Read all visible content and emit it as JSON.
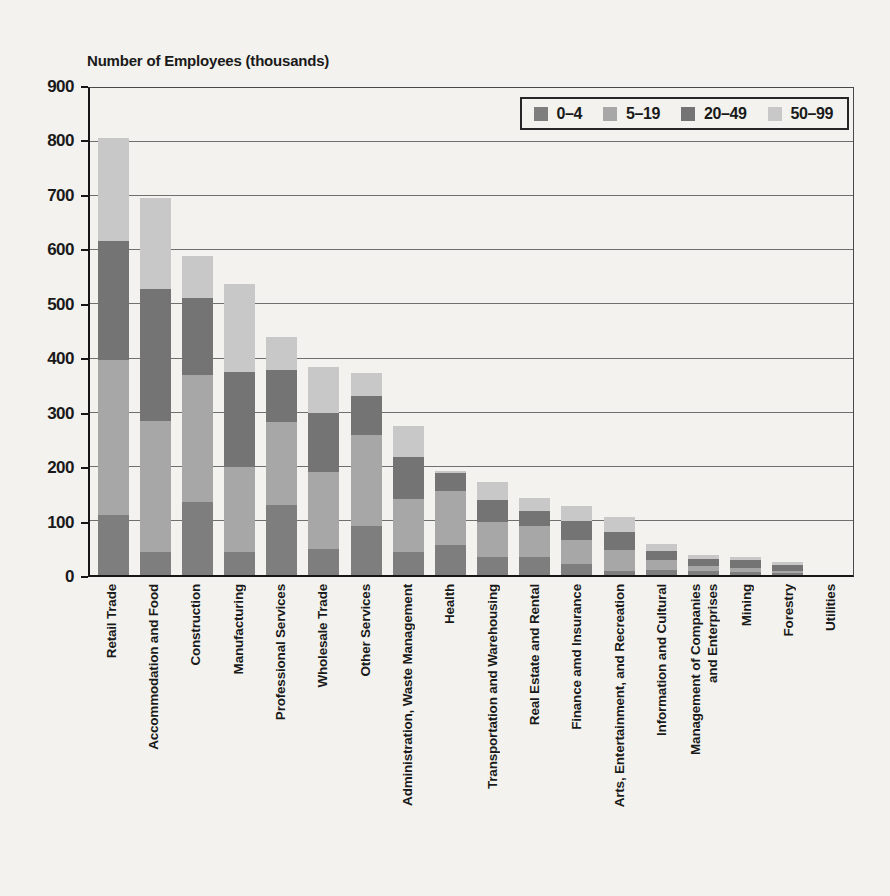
{
  "page": {
    "background": "#f3f2ee"
  },
  "chart_data": {
    "type": "bar",
    "stacked": true,
    "title": "Number of Employees (thousands)",
    "xlabel": "",
    "ylabel": "Number of Employees (thousands)",
    "ylim": [
      0,
      900
    ],
    "ytick_step": 100,
    "grid": "horizontal",
    "legend_position": "top-right",
    "categories": [
      "Retail Trade",
      "Accommodation and Food",
      "Construction",
      "Manufacturing",
      "Professional Services",
      "Wholesale Trade",
      "Other Services",
      "Administration, Waste Management",
      "Health",
      "Transportation and Warehousing",
      "Real Estate and Rental",
      "Finance amd Insurance",
      "Arts, Entertainment, and Recreation",
      "Information and Cultural",
      [
        "Management of Companies",
        "and Enterprises"
      ],
      "Mining",
      "Forestry",
      "Utilities"
    ],
    "series": [
      {
        "name": "0–4",
        "color": "#7e7e7e",
        "values": [
          110,
          42,
          135,
          43,
          130,
          48,
          90,
          42,
          55,
          33,
          33,
          20,
          7,
          10,
          8,
          6,
          4,
          0
        ]
      },
      {
        "name": "5–19",
        "color": "#a7a7a7",
        "values": [
          287,
          243,
          235,
          157,
          153,
          142,
          168,
          99,
          100,
          65,
          57,
          44,
          39,
          18,
          8,
          7,
          4,
          0
        ]
      },
      {
        "name": "20–49",
        "color": "#747474",
        "values": [
          221,
          243,
          142,
          175,
          95,
          110,
          72,
          78,
          33,
          40,
          28,
          36,
          34,
          17,
          14,
          14,
          10,
          0
        ]
      },
      {
        "name": "50–99",
        "color": "#c8c8c8",
        "values": [
          189,
          169,
          78,
          162,
          62,
          85,
          43,
          56,
          5,
          34,
          25,
          28,
          27,
          12,
          7,
          6,
          6,
          0
        ]
      }
    ]
  }
}
